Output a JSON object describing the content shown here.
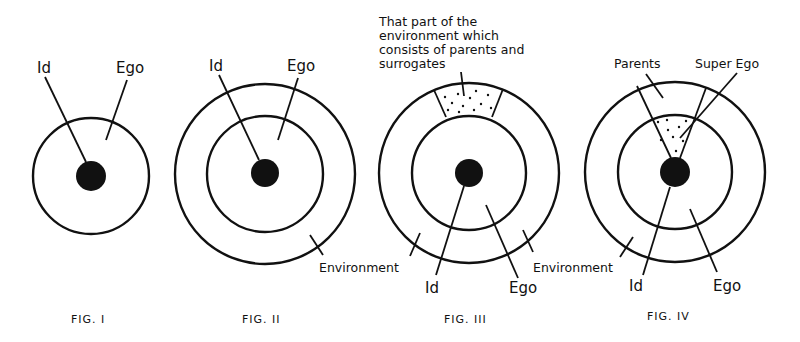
{
  "figures": [
    {
      "caption": "FIG. I",
      "labels": {
        "id": "Id",
        "ego": "Ego"
      }
    },
    {
      "caption": "FIG. II",
      "labels": {
        "id": "Id",
        "ego": "Ego",
        "environment": "Environment"
      }
    },
    {
      "caption": "FIG. III",
      "labels": {
        "annotation_line1": "That part of the",
        "annotation_line2": "environment which",
        "annotation_line3": "consists of parents and",
        "annotation_line4": "surrogates",
        "environment": "Environment",
        "id": "Id",
        "ego": "Ego"
      }
    },
    {
      "caption": "FIG. IV",
      "labels": {
        "parents": "Parents",
        "super_ego": "Super Ego",
        "id": "Id",
        "ego": "Ego"
      }
    }
  ],
  "colors": {
    "ink": "#111111",
    "background": "#ffffff"
  }
}
